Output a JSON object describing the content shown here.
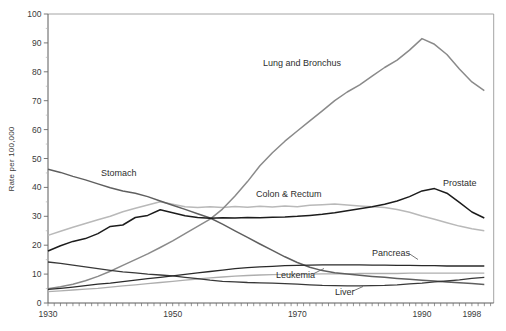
{
  "figure": {
    "background": "#ffffff"
  },
  "chart_data": {
    "type": "line",
    "title": "",
    "xlabel": "",
    "ylabel": "Rate per 100,000",
    "grid": false,
    "legend": "inline-labels",
    "x_range": [
      1930,
      2001.5
    ],
    "y_range": [
      0,
      100
    ],
    "x_tick_labels": [
      {
        "year": 1930,
        "text": "1930"
      },
      {
        "year": 1950,
        "text": "1950"
      },
      {
        "year": 1970,
        "text": "1970"
      },
      {
        "year": 1990,
        "text": "1990"
      },
      {
        "year": 1998,
        "text": "1998"
      }
    ],
    "x_minor_tick_step": 1,
    "y_tick_labels": [
      "0",
      "10",
      "20",
      "30",
      "40",
      "50",
      "60",
      "70",
      "80",
      "90",
      "100"
    ],
    "y_major_step": 10,
    "y_minor_step": 5,
    "x": [
      1930,
      1932,
      1934,
      1936,
      1938,
      1940,
      1942,
      1944,
      1946,
      1948,
      1950,
      1952,
      1954,
      1956,
      1958,
      1960,
      1962,
      1964,
      1966,
      1968,
      1970,
      1972,
      1974,
      1976,
      1978,
      1980,
      1982,
      1984,
      1986,
      1988,
      1990,
      1992,
      1994,
      1996,
      1998,
      2000
    ],
    "series": [
      {
        "name": "Colon & Rectum",
        "color": "#b9b9b9",
        "width": 1.5,
        "label_pos": [
          256,
          196.5
        ],
        "values": [
          23.4,
          24.8,
          26.2,
          27.5,
          28.8,
          30.0,
          31.6,
          32.8,
          33.9,
          35.0,
          34.2,
          33.3,
          33.0,
          33.3,
          33.0,
          33.4,
          33.1,
          33.5,
          33.2,
          33.6,
          33.3,
          33.8,
          34.0,
          34.3,
          33.9,
          33.6,
          33.3,
          33.0,
          32.4,
          31.4,
          30.1,
          29.0,
          27.8,
          26.6,
          25.7,
          25.0
        ]
      },
      {
        "name": "Leukemia",
        "color": "#aeaeae",
        "width": 1.3,
        "label_pos": [
          276,
          277.5
        ],
        "leader": [
          [
            314,
            273.5
          ],
          [
            324,
            268.5
          ]
        ],
        "values": [
          3.9,
          4.2,
          4.5,
          4.8,
          5.1,
          5.5,
          5.9,
          6.3,
          6.7,
          7.1,
          7.5,
          7.9,
          8.3,
          8.7,
          9.0,
          9.3,
          9.5,
          9.7,
          9.8,
          9.9,
          10.0,
          10.0,
          10.1,
          10.1,
          10.1,
          10.2,
          10.2,
          10.2,
          10.2,
          10.3,
          10.3,
          10.3,
          10.3,
          10.3,
          10.3,
          10.3
        ]
      },
      {
        "name": "Lung and Bronchus",
        "color": "#8a8a8a",
        "width": 1.5,
        "label_pos": [
          263,
          66
        ],
        "values": [
          4.9,
          5.6,
          6.5,
          7.7,
          9.2,
          11.0,
          13.0,
          15.0,
          17.0,
          19.2,
          21.5,
          24.0,
          26.5,
          29.0,
          32.5,
          37.0,
          42.0,
          47.5,
          52.0,
          56.0,
          59.5,
          63.0,
          66.5,
          70.0,
          73.0,
          75.5,
          78.5,
          81.5,
          84.0,
          87.5,
          91.5,
          89.5,
          86.0,
          81.0,
          76.5,
          73.5
        ]
      },
      {
        "name": "Stomach",
        "color": "#5f5f5f",
        "width": 1.5,
        "label_pos": [
          101,
          176
        ],
        "values": [
          46.3,
          45.2,
          43.8,
          42.6,
          41.2,
          39.9,
          38.8,
          38.0,
          36.8,
          35.3,
          33.8,
          32.4,
          30.9,
          29.4,
          27.3,
          25.0,
          22.7,
          20.4,
          18.2,
          16.0,
          14.0,
          12.4,
          11.2,
          10.5,
          10.0,
          9.6,
          9.2,
          8.9,
          8.5,
          8.2,
          7.9,
          7.6,
          7.3,
          7.0,
          6.7,
          6.4
        ]
      },
      {
        "name": "Liver",
        "color": "#383838",
        "width": 1.3,
        "label_pos": [
          335,
          294.5
        ],
        "leader": [
          [
            353,
            291
          ],
          [
            363,
            286.5
          ]
        ],
        "values": [
          14.2,
          13.7,
          13.1,
          12.5,
          11.9,
          11.3,
          10.8,
          10.4,
          10.0,
          9.7,
          9.4,
          8.9,
          8.4,
          7.9,
          7.5,
          7.3,
          7.1,
          7.0,
          6.9,
          6.7,
          6.5,
          6.3,
          6.1,
          6.0,
          5.9,
          5.9,
          6.0,
          6.1,
          6.3,
          6.6,
          6.9,
          7.3,
          7.6,
          8.0,
          8.5,
          8.9
        ]
      },
      {
        "name": "Pancreas",
        "color": "#2a2a2a",
        "width": 1.3,
        "label_pos": [
          372,
          255.5
        ],
        "leader": [
          [
            409,
            253.5
          ],
          [
            418,
            259.5
          ]
        ],
        "values": [
          4.7,
          5.1,
          5.5,
          6.0,
          6.5,
          6.9,
          7.4,
          7.9,
          8.4,
          8.9,
          9.4,
          9.9,
          10.4,
          10.9,
          11.4,
          11.9,
          12.2,
          12.5,
          12.7,
          12.9,
          13.0,
          13.1,
          13.2,
          13.2,
          13.2,
          13.2,
          13.1,
          13.1,
          13.0,
          13.0,
          12.9,
          12.9,
          12.8,
          12.8,
          12.8,
          12.8
        ]
      },
      {
        "name": "Prostate",
        "color": "#1c1c1c",
        "width": 1.5,
        "label_pos": [
          443,
          186
        ],
        "values": [
          18.0,
          19.8,
          21.3,
          22.3,
          24.0,
          26.5,
          27.0,
          29.6,
          30.3,
          32.3,
          31.2,
          30.2,
          29.6,
          29.3,
          29.5,
          29.4,
          29.6,
          29.5,
          29.7,
          29.8,
          30.0,
          30.3,
          30.7,
          31.2,
          31.9,
          32.6,
          33.3,
          34.2,
          35.3,
          36.8,
          38.8,
          39.6,
          38.0,
          34.8,
          31.5,
          29.4
        ]
      }
    ]
  }
}
